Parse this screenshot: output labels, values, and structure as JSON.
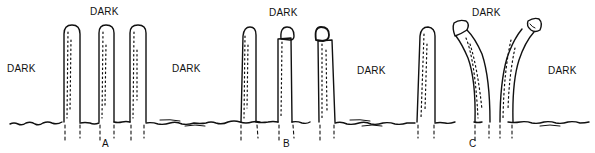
{
  "diagram": {
    "colors": {
      "ink": "#111111",
      "background": "#ffffff"
    },
    "condition_label": "DARK",
    "panels": [
      {
        "id": "A",
        "letter": "A",
        "dark_labels": [
          "DARK",
          "DARK",
          "DARK"
        ],
        "shoots": [
          {
            "type": "intact-tip"
          },
          {
            "type": "intact-tip"
          },
          {
            "type": "intact-tip"
          }
        ]
      },
      {
        "id": "B",
        "letter": "B",
        "dark_labels": [
          "DARK",
          "DARK"
        ],
        "shoots": [
          {
            "type": "intact-tip"
          },
          {
            "type": "tip-cap-centered"
          },
          {
            "type": "tip-cap-offset"
          }
        ]
      },
      {
        "id": "C",
        "letter": "C",
        "dark_labels": [
          "DARK",
          "DARK"
        ],
        "shoots": [
          {
            "type": "intact-tip"
          },
          {
            "type": "bent-left-with-cap"
          },
          {
            "type": "bent-right-with-cap"
          }
        ]
      }
    ]
  }
}
